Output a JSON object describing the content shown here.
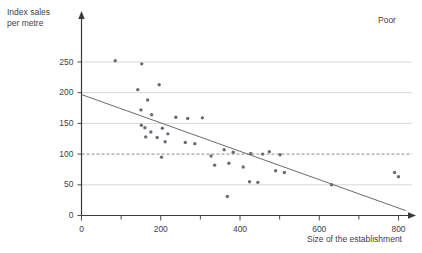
{
  "chart_data": {
    "type": "scatter",
    "title": "",
    "annotation": "Poor",
    "xlabel": "Size of the establishment",
    "ylabel": "Index sales\nper metre",
    "xlim": [
      0,
      820
    ],
    "ylim": [
      0,
      285
    ],
    "xticks": [
      0,
      200,
      400,
      600,
      800
    ],
    "xminorticks": [
      100,
      300,
      500,
      700
    ],
    "yticks": [
      0,
      50,
      100,
      150,
      200,
      250
    ],
    "gridlines_y": [
      50,
      100,
      150,
      200,
      250
    ],
    "dashed_gridline_y": 100,
    "grid": true,
    "legend": "none",
    "series": [
      {
        "name": "Establishments",
        "points": [
          [
            85,
            252
          ],
          [
            152,
            247
          ],
          [
            142,
            205
          ],
          [
            196,
            213
          ],
          [
            167,
            188
          ],
          [
            150,
            172
          ],
          [
            177,
            164
          ],
          [
            238,
            160
          ],
          [
            268,
            158
          ],
          [
            305,
            159
          ],
          [
            151,
            147
          ],
          [
            160,
            143
          ],
          [
            175,
            136
          ],
          [
            204,
            142
          ],
          [
            218,
            133
          ],
          [
            162,
            128
          ],
          [
            191,
            127
          ],
          [
            211,
            120
          ],
          [
            262,
            119
          ],
          [
            286,
            117
          ],
          [
            202,
            95
          ],
          [
            327,
            97
          ],
          [
            360,
            107
          ],
          [
            383,
            103
          ],
          [
            427,
            101
          ],
          [
            457,
            100
          ],
          [
            474,
            104
          ],
          [
            501,
            99
          ],
          [
            336,
            82
          ],
          [
            372,
            85
          ],
          [
            408,
            79
          ],
          [
            490,
            73
          ],
          [
            512,
            70
          ],
          [
            424,
            55
          ],
          [
            445,
            54
          ],
          [
            631,
            50
          ],
          [
            368,
            31
          ],
          [
            790,
            70
          ],
          [
            800,
            63
          ]
        ]
      }
    ],
    "trendline": {
      "x0": 0,
      "y0": 197,
      "x1": 818,
      "y1": 8,
      "style": "solid"
    }
  },
  "labels": {
    "y_title": "Index sales\nper metre",
    "x_title": "Size of the establishment",
    "corner": "Poor",
    "y_ticks": [
      "0",
      "50",
      "100",
      "150",
      "200",
      "250"
    ],
    "x_ticks": [
      "0",
      "200",
      "400",
      "600",
      "800"
    ]
  }
}
